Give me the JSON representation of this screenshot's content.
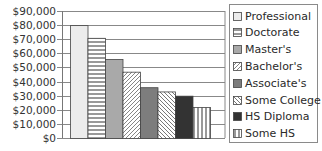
{
  "chart_data": {
    "type": "bar",
    "title": "",
    "xlabel": "",
    "ylabel": "",
    "ylim": [
      0,
      90000
    ],
    "yticks": [
      0,
      10000,
      20000,
      30000,
      40000,
      50000,
      60000,
      70000,
      80000,
      90000
    ],
    "ytick_labels": [
      "$0",
      "$10,000",
      "$20,000",
      "$30,000",
      "$40,000",
      "$50,000",
      "$60,000",
      "$70,000",
      "$80,000",
      "$90,000"
    ],
    "grid": true,
    "legend_position": "right",
    "categories": [
      "Professional",
      "Doctorate",
      "Master's",
      "Bachelor's",
      "Associate's",
      "Some College",
      "HS Diploma",
      "Some HS"
    ],
    "values": [
      80000,
      71000,
      56000,
      47000,
      36000,
      33000,
      30000,
      22000
    ],
    "series_styles": [
      {
        "name": "Professional",
        "fill": "#ececec",
        "pattern": "solid"
      },
      {
        "name": "Doctorate",
        "fill": "#ffffff",
        "pattern": "horizontal"
      },
      {
        "name": "Master's",
        "fill": "#a9a9a9",
        "pattern": "solid"
      },
      {
        "name": "Bachelor's",
        "fill": "#ffffff",
        "pattern": "diagonal-up"
      },
      {
        "name": "Associate's",
        "fill": "#7d7d7d",
        "pattern": "solid"
      },
      {
        "name": "Some College",
        "fill": "#ffffff",
        "pattern": "diagonal-down"
      },
      {
        "name": "HS Diploma",
        "fill": "#333333",
        "pattern": "solid"
      },
      {
        "name": "Some HS",
        "fill": "#ffffff",
        "pattern": "vertical"
      }
    ]
  },
  "legend": {
    "items": [
      "Professional",
      "Doctorate",
      "Master's",
      "Bachelor's",
      "Associate's",
      "Some College",
      "HS Diploma",
      "Some HS"
    ]
  }
}
